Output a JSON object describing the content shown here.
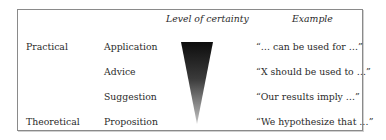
{
  "headers": {
    "certainty": "Level of certainty",
    "example": "Example"
  },
  "categories": {
    "practical": "Practical",
    "theoretical": "Theoretical"
  },
  "rows": [
    {
      "type": "Application",
      "example": "“… can be used for …”"
    },
    {
      "type": "Advice",
      "example": "“X should be used to …”"
    },
    {
      "type": "Suggestion",
      "example": "“Our results imply …”"
    },
    {
      "type": "Proposition",
      "example": "“We hypothesize that …”"
    }
  ],
  "colors": {
    "triangle_top": "#111111",
    "triangle_bottom": "#bbbbbb",
    "border": "#8a8a8a"
  }
}
